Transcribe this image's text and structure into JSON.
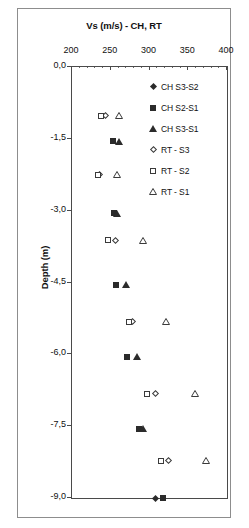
{
  "chart_data": {
    "type": "scatter",
    "title": "Vs (m/s) - CH, RT",
    "xlabel": "Vs (m/s) - CH, RT",
    "ylabel": "Depth (m)",
    "xlim": [
      200,
      400
    ],
    "ylim": [
      -9.0,
      0.0
    ],
    "xticks": [
      200,
      250,
      300,
      350,
      400
    ],
    "xtick_labels": [
      "200",
      "250",
      "300",
      "350",
      "400"
    ],
    "yticks": [
      0.0,
      -1.5,
      -3.0,
      -4.5,
      -6.0,
      -7.5,
      -9.0
    ],
    "ytick_labels": [
      "0,0",
      "-1,5",
      "-3,0",
      "-4,5",
      "-6,0",
      "-7,5",
      "-9,0"
    ],
    "grid": false,
    "legend_position": "top-right",
    "series": [
      {
        "name": "CH S3-S2",
        "marker": "diamond-filled",
        "color": "#2b2b2b",
        "points": [
          {
            "x": 308,
            "y": -9.0
          }
        ]
      },
      {
        "name": "CH S2-S1",
        "marker": "square-filled",
        "color": "#2b2b2b",
        "points": [
          {
            "x": 253,
            "y": -1.55
          },
          {
            "x": 254,
            "y": -3.05
          },
          {
            "x": 257,
            "y": -4.55
          },
          {
            "x": 271,
            "y": -6.05
          },
          {
            "x": 286,
            "y": -7.55
          },
          {
            "x": 317,
            "y": -9.0
          }
        ]
      },
      {
        "name": "CH S3-S1",
        "marker": "triangle-filled",
        "color": "#2b2b2b",
        "points": [
          {
            "x": 261,
            "y": -1.55
          },
          {
            "x": 258,
            "y": -3.05
          },
          {
            "x": 270,
            "y": -4.55
          },
          {
            "x": 284,
            "y": -6.05
          },
          {
            "x": 292,
            "y": -7.55
          }
        ]
      },
      {
        "name": "RT - S3",
        "marker": "diamond-open",
        "color": "#3a3a3a",
        "points": [
          {
            "x": 243,
            "y": -1.02
          },
          {
            "x": 235,
            "y": -2.25
          },
          {
            "x": 256,
            "y": -3.62
          },
          {
            "x": 278,
            "y": -5.32
          },
          {
            "x": 308,
            "y": -6.82
          },
          {
            "x": 325,
            "y": -8.22
          }
        ]
      },
      {
        "name": "RT - S2",
        "marker": "square-open",
        "color": "#3a3a3a",
        "points": [
          {
            "x": 238,
            "y": -1.02
          },
          {
            "x": 233,
            "y": -2.25
          },
          {
            "x": 247,
            "y": -3.62
          },
          {
            "x": 273,
            "y": -5.32
          },
          {
            "x": 297,
            "y": -6.82
          },
          {
            "x": 315,
            "y": -8.22
          }
        ]
      },
      {
        "name": "RT - S1",
        "marker": "triangle-open",
        "color": "#3a3a3a",
        "points": [
          {
            "x": 260,
            "y": -1.02
          },
          {
            "x": 258,
            "y": -2.25
          },
          {
            "x": 292,
            "y": -3.62
          },
          {
            "x": 321,
            "y": -5.32
          },
          {
            "x": 359,
            "y": -6.82
          },
          {
            "x": 373,
            "y": -8.22
          }
        ]
      }
    ]
  },
  "legend": {
    "items": [
      {
        "label": "CH S3-S2",
        "marker": "diamond-filled"
      },
      {
        "label": "CH S2-S1",
        "marker": "square-filled"
      },
      {
        "label": "CH S3-S1",
        "marker": "triangle-filled"
      },
      {
        "label": "RT - S3",
        "marker": "diamond-open"
      },
      {
        "label": "RT - S2",
        "marker": "square-open"
      },
      {
        "label": "RT - S1",
        "marker": "triangle-open"
      }
    ]
  }
}
